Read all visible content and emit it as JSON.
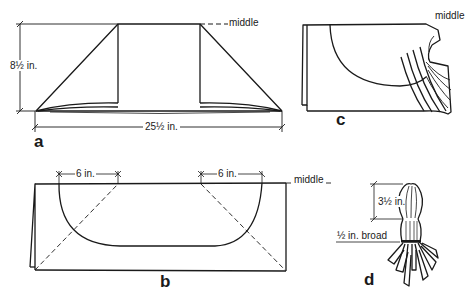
{
  "figures": {
    "a": {
      "letter": "a",
      "height_label": "8½ in.",
      "width_label": "25½ in.",
      "middle_label": "middle"
    },
    "b": {
      "letter": "b",
      "left_measure": "6 in.",
      "right_measure": "6 in.",
      "middle_label": "middle"
    },
    "c": {
      "letter": "c",
      "middle_label": "middle"
    },
    "d": {
      "letter": "d",
      "height_label": "3½ in.",
      "broad_label": "½ in. broad"
    }
  },
  "colors": {
    "line": "#1a1a1a",
    "background": "#ffffff"
  }
}
